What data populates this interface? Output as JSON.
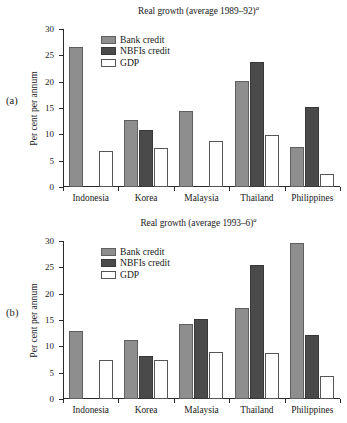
{
  "figure": {
    "panels": [
      {
        "panel_label": "(a)",
        "title": "Real growth (average 1989–92)",
        "title_superscript": "a"
      },
      {
        "panel_label": "(b)",
        "title": "Real growth (average 1993–6)",
        "title_superscript": "a"
      }
    ],
    "legend": [
      {
        "label": "Bank credit",
        "color": "#8e8e8e"
      },
      {
        "label": "NBFIs credit",
        "color": "#4a4a4a"
      },
      {
        "label": "GDP",
        "color": "#ffffff"
      }
    ]
  },
  "chart_data": [
    {
      "type": "bar",
      "title": "Real growth (average 1989–92)a",
      "panel": "(a)",
      "xlabel": "",
      "ylabel": "Per cent per annum",
      "ylim": [
        0,
        30
      ],
      "yticks": [
        0,
        5,
        10,
        15,
        20,
        25,
        30
      ],
      "ytick_labels": [
        "0",
        "5",
        "10",
        "15",
        "20",
        "25",
        "30"
      ],
      "grid": false,
      "legend_position": "upper-center-left",
      "categories": [
        "Indonesia",
        "Korea",
        "Malaysia",
        "Thailand",
        "Philippines"
      ],
      "series": [
        {
          "name": "Bank credit",
          "values": [
            26.5,
            12.8,
            14.4,
            20.2,
            7.6
          ]
        },
        {
          "name": "NBFIs credit",
          "values": [
            null,
            10.9,
            null,
            23.7,
            15.2
          ]
        },
        {
          "name": "GDP",
          "values": [
            6.9,
            7.4,
            8.8,
            9.9,
            2.4
          ]
        }
      ]
    },
    {
      "type": "bar",
      "title": "Real growth (average 1993–6)a",
      "panel": "(b)",
      "xlabel": "",
      "ylabel": "Per cent per annum",
      "ylim": [
        0,
        30
      ],
      "yticks": [
        0,
        5,
        10,
        15,
        20,
        25,
        30
      ],
      "ytick_labels": [
        "0",
        "5",
        "10",
        "15",
        "20",
        "25",
        "30"
      ],
      "grid": false,
      "legend_position": "upper-center-left",
      "categories": [
        "Indonesia",
        "Korea",
        "Malaysia",
        "Thailand",
        "Philippines"
      ],
      "series": [
        {
          "name": "Bank credit",
          "values": [
            13.0,
            11.3,
            14.3,
            17.2,
            29.6
          ]
        },
        {
          "name": "NBFIs credit",
          "values": [
            null,
            8.1,
            15.2,
            25.5,
            12.2
          ]
        },
        {
          "name": "GDP",
          "values": [
            7.5,
            7.5,
            9.0,
            8.7,
            4.4
          ]
        }
      ]
    }
  ]
}
